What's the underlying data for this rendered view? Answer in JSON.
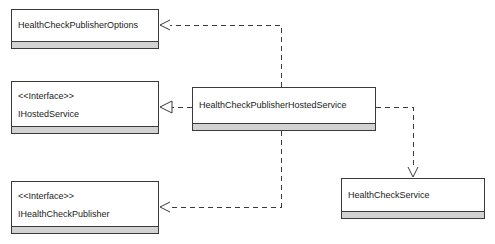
{
  "diagram": {
    "type": "uml-class-diagram",
    "background_color": "#ffffff",
    "line_color": "#3a3a3a",
    "compartment_color": "#d2d2d2",
    "text_color": "#1a1a1a"
  },
  "nodes": [
    {
      "id": "health-check-publisher-options",
      "name": "HealthCheckPublisherOptions",
      "stereotype": "",
      "kind": "class",
      "x": 11,
      "y": 9,
      "width": 148,
      "height": 40
    },
    {
      "id": "ihosted-service",
      "name": "IHostedService",
      "stereotype": "<<Interface>>",
      "kind": "interface",
      "x": 11,
      "y": 81,
      "width": 148,
      "height": 53
    },
    {
      "id": "ihealth-check-publisher",
      "name": "IHealthCheckPublisher",
      "stereotype": "<<Interface>>",
      "kind": "interface",
      "x": 11,
      "y": 181,
      "width": 148,
      "height": 53
    },
    {
      "id": "health-check-publisher-hosted-service",
      "name": "HealthCheckPublisherHostedService",
      "stereotype": "",
      "kind": "class",
      "x": 192,
      "y": 87,
      "width": 184,
      "height": 44
    },
    {
      "id": "health-check-service",
      "name": "HealthCheckService",
      "stereotype": "",
      "kind": "class",
      "x": 341,
      "y": 178,
      "width": 144,
      "height": 41
    }
  ],
  "edges": [
    {
      "id": "edge-options",
      "from": "health-check-publisher-hosted-service",
      "to": "health-check-publisher-options",
      "relationship": "dependency",
      "arrowhead": "open",
      "style": "dashed"
    },
    {
      "id": "edge-ihosted-service",
      "from": "health-check-publisher-hosted-service",
      "to": "ihosted-service",
      "relationship": "realization",
      "arrowhead": "hollow-triangle",
      "style": "dashed"
    },
    {
      "id": "edge-ihealth-check-publisher",
      "from": "health-check-publisher-hosted-service",
      "to": "ihealth-check-publisher",
      "relationship": "dependency",
      "arrowhead": "open",
      "style": "dashed"
    },
    {
      "id": "edge-health-check-service",
      "from": "health-check-publisher-hosted-service",
      "to": "health-check-service",
      "relationship": "dependency",
      "arrowhead": "open",
      "style": "dashed"
    }
  ]
}
